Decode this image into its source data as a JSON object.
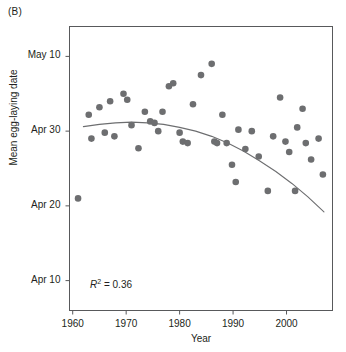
{
  "figure": {
    "panel_label": "(B)",
    "background_color": "#ffffff"
  },
  "chart_data": {
    "type": "scatter",
    "title": "",
    "subtitle": "",
    "xlabel": "Year",
    "ylabel": "Mean egg-laying date",
    "xlim": [
      1959.4,
      2008.6
    ],
    "ylim": [
      6.0,
      44.0
    ],
    "grid": false,
    "legend": null,
    "annotations": [
      {
        "name": "r-squared",
        "text": "R2 = 0.36",
        "r_symbol": "R",
        "exponent": "2",
        "equals": " = 0.36",
        "value": 0.36,
        "x": 1964,
        "y": 8.5
      }
    ],
    "y_axis_note": "Y values expressed as day-of-April-equivalent: Apr 10 = 10, Apr 20 = 20, Apr 30 = 30, May 10 = 40",
    "xticks": [
      1960,
      1970,
      1980,
      1990,
      2000
    ],
    "xticklabels": [
      "1960",
      "1970",
      "1980",
      "1990",
      "2000"
    ],
    "yticks": [
      10,
      20,
      30,
      40
    ],
    "yticklabels": [
      "Apr 10",
      "Apr 20",
      "Apr 30",
      "May 10"
    ],
    "marker": {
      "shape": "circle",
      "color": "#6d6e70",
      "size": 4.6
    },
    "points": [
      {
        "x": 1961,
        "y": 21.0
      },
      {
        "x": 1963,
        "y": 32.2
      },
      {
        "x": 1963.5,
        "y": 29.0
      },
      {
        "x": 1965,
        "y": 33.2
      },
      {
        "x": 1966,
        "y": 29.8
      },
      {
        "x": 1967,
        "y": 34.0
      },
      {
        "x": 1967.8,
        "y": 29.3
      },
      {
        "x": 1969.5,
        "y": 35.0
      },
      {
        "x": 1970.2,
        "y": 34.2
      },
      {
        "x": 1971,
        "y": 30.8
      },
      {
        "x": 1972.3,
        "y": 27.7
      },
      {
        "x": 1973.5,
        "y": 32.6
      },
      {
        "x": 1974.5,
        "y": 31.3
      },
      {
        "x": 1975.3,
        "y": 31.1
      },
      {
        "x": 1976,
        "y": 30.0
      },
      {
        "x": 1976.8,
        "y": 32.6
      },
      {
        "x": 1978,
        "y": 36.0
      },
      {
        "x": 1978.8,
        "y": 36.4
      },
      {
        "x": 1980,
        "y": 29.8
      },
      {
        "x": 1980.6,
        "y": 28.6
      },
      {
        "x": 1981.5,
        "y": 28.4
      },
      {
        "x": 1982.5,
        "y": 33.6
      },
      {
        "x": 1984,
        "y": 37.5
      },
      {
        "x": 1986,
        "y": 39.0
      },
      {
        "x": 1986.5,
        "y": 28.6
      },
      {
        "x": 1987,
        "y": 28.4
      },
      {
        "x": 1988,
        "y": 32.2
      },
      {
        "x": 1988.8,
        "y": 28.4
      },
      {
        "x": 1989.8,
        "y": 25.5
      },
      {
        "x": 1990.5,
        "y": 23.2
      },
      {
        "x": 1991,
        "y": 30.2
      },
      {
        "x": 1992.3,
        "y": 27.6
      },
      {
        "x": 1993.5,
        "y": 30.0
      },
      {
        "x": 1994.8,
        "y": 26.6
      },
      {
        "x": 1996.5,
        "y": 22.0
      },
      {
        "x": 1997.5,
        "y": 29.3
      },
      {
        "x": 1998.8,
        "y": 34.5
      },
      {
        "x": 1999.8,
        "y": 28.6
      },
      {
        "x": 2000.5,
        "y": 27.2
      },
      {
        "x": 2001.6,
        "y": 22.0
      },
      {
        "x": 2002,
        "y": 30.5
      },
      {
        "x": 2003,
        "y": 33.0
      },
      {
        "x": 2003.6,
        "y": 28.4
      },
      {
        "x": 2004.6,
        "y": 26.2
      },
      {
        "x": 2006,
        "y": 29.0
      },
      {
        "x": 2006.8,
        "y": 24.2
      }
    ],
    "fit_curve": {
      "name": "quadratic-fit",
      "color": "#6d6e70",
      "width": 1.1,
      "r_squared": 0.36,
      "points": [
        {
          "x": 1962.0,
          "y": 30.6
        },
        {
          "x": 1965.0,
          "y": 30.9
        },
        {
          "x": 1968.0,
          "y": 31.1
        },
        {
          "x": 1971.0,
          "y": 31.2
        },
        {
          "x": 1974.0,
          "y": 31.1
        },
        {
          "x": 1977.0,
          "y": 30.9
        },
        {
          "x": 1980.0,
          "y": 30.5
        },
        {
          "x": 1983.0,
          "y": 30.0
        },
        {
          "x": 1986.0,
          "y": 29.3
        },
        {
          "x": 1989.0,
          "y": 28.4
        },
        {
          "x": 1992.0,
          "y": 27.3
        },
        {
          "x": 1995.0,
          "y": 26.0
        },
        {
          "x": 1998.0,
          "y": 24.6
        },
        {
          "x": 2001.0,
          "y": 23.0
        },
        {
          "x": 2004.0,
          "y": 21.2
        },
        {
          "x": 2007.0,
          "y": 19.2
        }
      ]
    }
  }
}
